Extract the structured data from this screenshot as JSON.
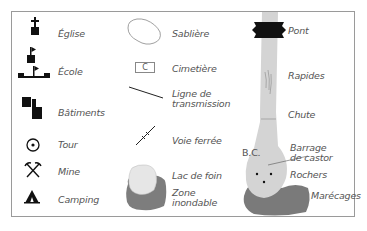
{
  "legend": {
    "column1": [
      {
        "label": "Église",
        "icon": "church-icon"
      },
      {
        "label": "École",
        "icon": "school-icon"
      },
      {
        "label": "Bâtiments",
        "icon": "buildings-icon"
      },
      {
        "label": "Tour",
        "icon": "tower-icon"
      },
      {
        "label": "Mine",
        "icon": "mine-icon"
      },
      {
        "label": "Camping",
        "icon": "camping-icon"
      }
    ],
    "column2": [
      {
        "label": "Sablière",
        "icon": "sandpit-icon"
      },
      {
        "label": "Cimetière",
        "icon": "cemetery-icon",
        "glyph": "C"
      },
      {
        "label": "Ligne de\ntransmission",
        "icon": "power-line-icon"
      },
      {
        "label": "Voie ferrée",
        "icon": "railway-icon"
      },
      {
        "label": "Lac de foin",
        "icon": "hay-lake-icon"
      },
      {
        "label": "Zone\ninondable",
        "icon": "flood-zone-icon"
      }
    ],
    "column3": [
      {
        "label": "Pont",
        "icon": "bridge-icon"
      },
      {
        "label": "Rapides",
        "icon": "rapids-icon"
      },
      {
        "label": "Chute",
        "icon": "waterfall-icon"
      },
      {
        "label": "Barrage\nde castor",
        "icon": "beaver-dam-icon",
        "abbrev": "B.C."
      },
      {
        "label": "Rochers",
        "icon": "rocks-icon"
      },
      {
        "label": "Marécages",
        "icon": "swamp-icon"
      }
    ]
  },
  "colors": {
    "symbol": "#111111",
    "water": "#d4d4d4",
    "swamp": "#7a7a7a",
    "flood": "#7d7d7d",
    "hay_lake": "#e6e6e6",
    "border": "#9a9a9a",
    "label": "#555555"
  }
}
